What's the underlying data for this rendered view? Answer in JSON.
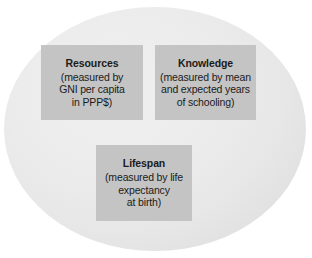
{
  "diagram": {
    "shape": "ellipse",
    "ellipse_fill": "#ececec",
    "box_fill": "#c4c4c4",
    "text_color": "#1b1b1b",
    "boxes": [
      {
        "id": "resources",
        "title": "Resources",
        "description": "(measured by\nGNI per capita\nin PPP$)"
      },
      {
        "id": "knowledge",
        "title": "Knowledge",
        "description": "(measured by mean\nand expected years\nof schooling)"
      },
      {
        "id": "lifespan",
        "title": "Lifespan",
        "description": "(measured by life\nexpectancy\nat birth)"
      }
    ]
  }
}
